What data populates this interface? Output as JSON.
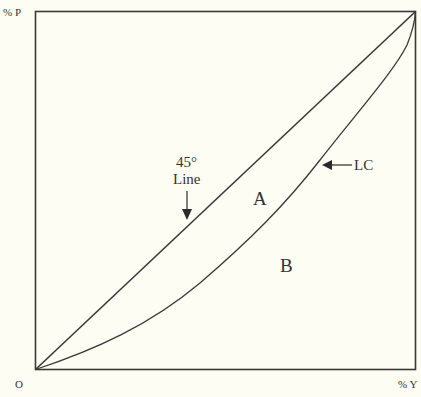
{
  "diagram": {
    "axes": {
      "y_label": "% P",
      "x_label": "% Y",
      "origin_label": "O"
    },
    "annotations": {
      "line_45_top": "45°",
      "line_45_bottom": "Line",
      "lc_label": "LC",
      "region_a": "A",
      "region_b": "B"
    },
    "colors": {
      "background": "#fdfdf3",
      "stroke": "#3a3a3a",
      "text": "#333333"
    },
    "elements": [
      {
        "name": "frame-box",
        "type": "rectangle"
      },
      {
        "name": "line-45-degree",
        "type": "line",
        "from": "O",
        "to": "top-right corner"
      },
      {
        "name": "lorenz-curve",
        "type": "curve",
        "from": "O",
        "to": "top-right corner"
      }
    ]
  }
}
